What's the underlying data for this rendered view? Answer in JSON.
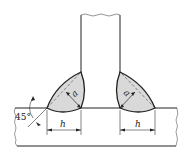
{
  "diagram": {
    "type": "fillet-weld-t-joint",
    "labels": {
      "throat_left": "a",
      "throat_right": "a",
      "leg_left": "h",
      "leg_right": "h",
      "angle": "45°"
    },
    "colors": {
      "line": "#222222",
      "weld_fill": "#d9d9d9",
      "background": "#ffffff"
    }
  }
}
